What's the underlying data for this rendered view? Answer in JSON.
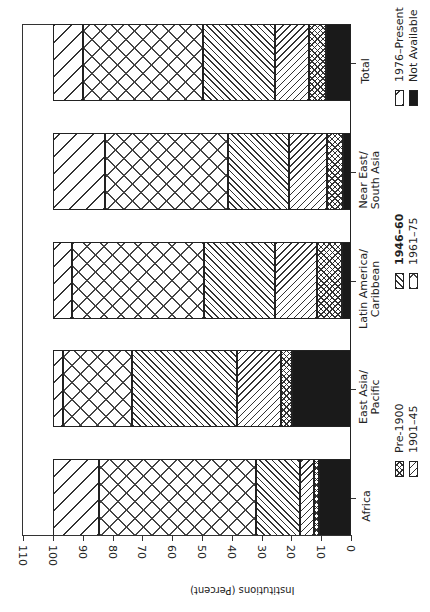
{
  "chart_data": {
    "type": "bar",
    "orientation": "stacked, rotated 90° (horizontal bars, axis reads 110 → 0 left to right)",
    "title": "",
    "xlabel": "",
    "ylabel": "Institutions (Percent)",
    "ylim": [
      0,
      110
    ],
    "yticks": [
      0,
      10,
      20,
      30,
      40,
      50,
      60,
      70,
      80,
      90,
      100,
      110
    ],
    "categories": [
      "Africa",
      "East Asia/ Pacific",
      "Latin America/ Caribbean",
      "Near East/ South Asia",
      "Total"
    ],
    "series": [
      {
        "name": "Not Available",
        "pattern": "solid-black",
        "values": [
          10.7,
          19.9,
          3.1,
          2.8,
          8.4
        ]
      },
      {
        "name": "Pre-1900",
        "pattern": "fine-crosshatch",
        "values": [
          1.8,
          3.7,
          8.4,
          5.2,
          5.6
        ]
      },
      {
        "name": "1901–45",
        "pattern": "diagonal-sparse",
        "values": [
          4.5,
          14.8,
          13.9,
          12.7,
          11.5
        ]
      },
      {
        "name": "1946–60",
        "pattern": "diagonal-dense",
        "values": [
          15.0,
          35.1,
          23.8,
          20.7,
          24.1
        ]
      },
      {
        "name": "1961–75",
        "pattern": "large-crosshatch",
        "values": [
          52.5,
          23.1,
          44.3,
          41.2,
          40.2
        ]
      },
      {
        "name": "1976–Present",
        "pattern": "diagonal-wide",
        "values": [
          15.5,
          3.4,
          6.5,
          17.4,
          10.2
        ]
      }
    ],
    "legend": {
      "position": "right",
      "entries": [
        "Pre-1900",
        "1901–45",
        "1946–60",
        "1961–75",
        "1976–Present",
        "Not Available"
      ]
    },
    "grid": false
  },
  "axis": {
    "title": "Institutions (Percent)",
    "ticks": [
      "0",
      "10",
      "20",
      "30",
      "40",
      "50",
      "60",
      "70",
      "80",
      "90",
      "100",
      "110"
    ]
  },
  "categories": [
    {
      "line1": "Africa",
      "line2": ""
    },
    {
      "line1": "East Asia/",
      "line2": "Pacific"
    },
    {
      "line1": "Latin America/",
      "line2": "Caribbean"
    },
    {
      "line1": "Near East/",
      "line2": "South Asia"
    },
    {
      "line1": "Total",
      "line2": ""
    }
  ],
  "legend": [
    {
      "label": "Pre-1900",
      "pattern": "fine-crosshatch",
      "bold": false
    },
    {
      "label": "1901–45",
      "pattern": "diagonal-sparse",
      "bold": false
    },
    {
      "label": "1946–60",
      "pattern": "diagonal-dense",
      "bold": true
    },
    {
      "label": "1961–75",
      "pattern": "large-crosshatch",
      "bold": false
    },
    {
      "label": "1976–Present",
      "pattern": "diagonal-wide",
      "bold": false
    },
    {
      "label": "Not Available",
      "pattern": "solid-black",
      "bold": false
    }
  ]
}
